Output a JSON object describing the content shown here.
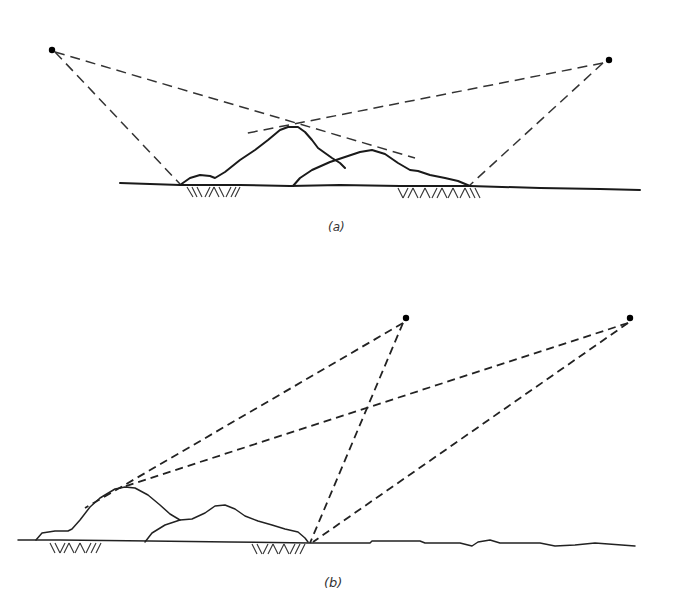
{
  "figure": {
    "panel_a": {
      "label": "(a)",
      "aircraft": [
        {
          "name": "aircraft-left",
          "x": 47,
          "y": 50
        },
        {
          "name": "aircraft-right",
          "x": 610,
          "y": 60
        }
      ],
      "description": "Two aircraft view the terrain from opposite sides; sight lines graze the peak of the near hill, leaving shadowed ground zones (hatched) at the hill bases."
    },
    "panel_b": {
      "label": "(b)",
      "aircraft": [
        {
          "name": "aircraft-left",
          "x": 405,
          "y": 318
        },
        {
          "name": "aircraft-right",
          "x": 630,
          "y": 318
        }
      ],
      "description": "Two aircraft on the same side view the terrain; sight lines cross between them and graze the hill peak, leaving two shadowed (hatched) zones."
    }
  }
}
